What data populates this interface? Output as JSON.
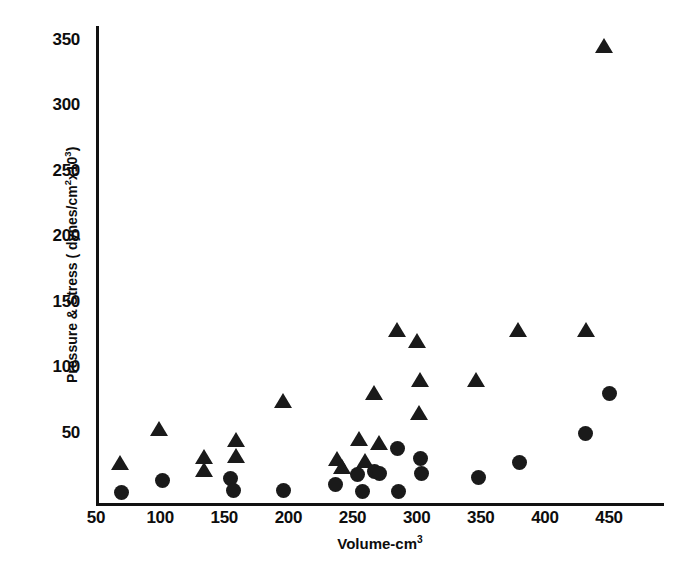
{
  "chart_data": {
    "type": "scatter",
    "title": "",
    "xlabel": "Volume-cm3",
    "xlabel_base": "Volume-cm",
    "xlabel_exponent": "3",
    "ylabel": "Pressure & Stress ( dynes/cm2x103)",
    "ylabel_part1": "Pressure & Stress ( dynes/cm",
    "ylabel_sup1": "2",
    "ylabel_part2": "x10",
    "ylabel_sup2": "3",
    "ylabel_part3": ")",
    "xlim": [
      50,
      470
    ],
    "ylim": [
      0,
      365
    ],
    "xticks": [
      50,
      100,
      150,
      200,
      250,
      300,
      350,
      400,
      450
    ],
    "xtick_labels": [
      "50",
      "100",
      "150",
      "200",
      "250",
      "300",
      "350",
      "400",
      "450"
    ],
    "yticks": [
      50,
      100,
      150,
      200,
      250,
      300,
      350
    ],
    "ytick_labels": [
      "50",
      "100",
      "150",
      "200",
      "250",
      "300",
      "350"
    ],
    "grid": false,
    "legend": "none",
    "marker_color": "#1a1a1a",
    "series": [
      {
        "name": "Stress (triangles)",
        "marker": "triangle",
        "color": "#1a1a1a",
        "points": [
          [
            69,
            27
          ],
          [
            99,
            53
          ],
          [
            134,
            31
          ],
          [
            134,
            21
          ],
          [
            159,
            44
          ],
          [
            159,
            32
          ],
          [
            196,
            74
          ],
          [
            238,
            30
          ],
          [
            242,
            24
          ],
          [
            255,
            45
          ],
          [
            260,
            28
          ],
          [
            267,
            80
          ],
          [
            271,
            42
          ],
          [
            285,
            128
          ],
          [
            300,
            120
          ],
          [
            302,
            65
          ],
          [
            303,
            90
          ],
          [
            346,
            90
          ],
          [
            379,
            128
          ],
          [
            432,
            128
          ],
          [
            446,
            345
          ]
        ]
      },
      {
        "name": "Pressure (circles)",
        "marker": "circle",
        "color": "#1a1a1a",
        "points": [
          [
            70,
            4
          ],
          [
            102,
            13
          ],
          [
            155,
            15
          ],
          [
            157,
            6
          ],
          [
            196,
            6
          ],
          [
            237,
            10
          ],
          [
            254,
            18
          ],
          [
            258,
            5
          ],
          [
            267,
            20
          ],
          [
            271,
            19
          ],
          [
            285,
            38
          ],
          [
            286,
            5
          ],
          [
            303,
            30
          ],
          [
            304,
            19
          ],
          [
            348,
            16
          ],
          [
            380,
            27
          ],
          [
            432,
            49
          ],
          [
            450,
            80
          ]
        ]
      }
    ]
  },
  "axes": {
    "y_axis_name": "pressure-stress-axis",
    "x_axis_name": "volume-axis"
  }
}
